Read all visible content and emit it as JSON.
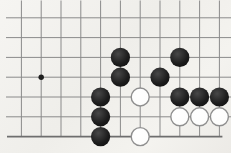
{
  "board": {
    "type": "go-board-fragment",
    "grid": {
      "cols": 11,
      "rows": 7,
      "bottom_row_is_board_edge": true,
      "cropped_edges": [
        "top",
        "left",
        "right"
      ]
    },
    "star_points": [
      {
        "col": 2,
        "row": 4
      }
    ],
    "stones": [
      {
        "color": "black",
        "col": 6,
        "row": 3
      },
      {
        "color": "black",
        "col": 9,
        "row": 3
      },
      {
        "color": "black",
        "col": 6,
        "row": 4
      },
      {
        "color": "black",
        "col": 8,
        "row": 4
      },
      {
        "color": "black",
        "col": 5,
        "row": 5
      },
      {
        "color": "white",
        "col": 7,
        "row": 5
      },
      {
        "color": "black",
        "col": 9,
        "row": 5
      },
      {
        "color": "black",
        "col": 10,
        "row": 5
      },
      {
        "color": "black",
        "col": 11,
        "row": 5
      },
      {
        "color": "black",
        "col": 5,
        "row": 6
      },
      {
        "color": "white",
        "col": 9,
        "row": 6
      },
      {
        "color": "white",
        "col": 10,
        "row": 6
      },
      {
        "color": "white",
        "col": 11,
        "row": 6
      },
      {
        "color": "black",
        "col": 5,
        "row": 7
      },
      {
        "color": "white",
        "col": 7,
        "row": 7
      }
    ],
    "counts": {
      "black": 10,
      "white": 5
    },
    "colors": {
      "background": "#f3f2ef",
      "grid_line": "#8a8a8a",
      "board_edge_line": "#6e6e6e",
      "star_point": "#1f1f1f",
      "black_stone": "#1c1c1c",
      "black_stone_highlight": "#484848",
      "white_stone_fill": "#fdfdfc",
      "white_stone_border": "#8f8f8f"
    }
  }
}
